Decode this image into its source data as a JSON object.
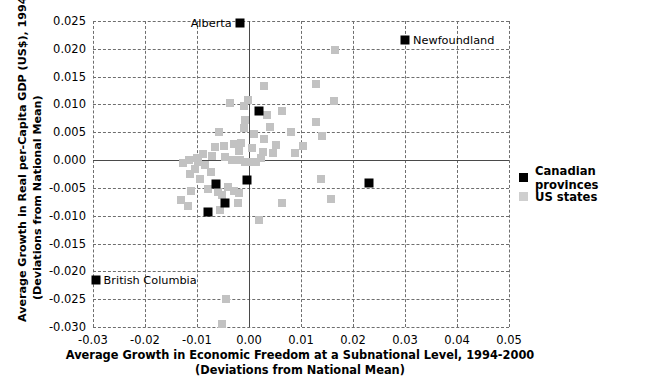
{
  "axes": {
    "ylabel_line1": "Average Growth in Real per-Capita GDP (US$), 1994-2000",
    "ylabel_line2": "(Deviations from National Mean)",
    "xlabel_line1": "Average Growth in Economic Freedom at a Subnational Level, 1994-2000",
    "xlabel_line2": "(Deviations from National Mean)",
    "yticks": [
      "0.025",
      "0.020",
      "0.015",
      "0.010",
      "0.005",
      "0.000",
      "-0.005",
      "-0.010",
      "-0.015",
      "-0.020",
      "-0.025",
      "-0.030"
    ],
    "xticks": [
      "-0.03",
      "-0.02",
      "-0.01",
      "0.00",
      "0.01",
      "0.02",
      "0.03",
      "0.04",
      "0.05"
    ]
  },
  "legend": {
    "items": [
      {
        "label": "Canadian provinces",
        "color": "#000000",
        "key": "ca"
      },
      {
        "label": "US states",
        "color": "#cfcfcf",
        "key": "us"
      }
    ]
  },
  "annotations": [
    {
      "text": "Alberta",
      "x": -0.0018,
      "y": 0.0247,
      "align": "left"
    },
    {
      "text": "Newfoundland",
      "x": 0.03,
      "y": 0.0215,
      "align": "right"
    },
    {
      "text": "British Columbia",
      "x": -0.0295,
      "y": -0.0215,
      "align": "right"
    }
  ],
  "chart_data": {
    "type": "scatter",
    "title": "",
    "xlabel": "Average Growth in Economic Freedom at a Subnational Level, 1994-2000 (Deviations from National Mean)",
    "ylabel": "Average Growth in Real per-Capita GDP (US$), 1994-2000 (Deviations from National Mean)",
    "xlim": [
      -0.03,
      0.05
    ],
    "ylim": [
      -0.03,
      0.025
    ],
    "grid": true,
    "legend_position": "right",
    "colors": {
      "canadian_provinces": "#000000",
      "us_states": "#c2c2c2"
    },
    "series": [
      {
        "name": "Canadian provinces",
        "color": "#000000",
        "points": [
          {
            "x": -0.0018,
            "y": 0.0247,
            "label": "Alberta"
          },
          {
            "x": 0.03,
            "y": 0.0215,
            "label": "Newfoundland"
          },
          {
            "x": 0.002,
            "y": 0.0088,
            "label": ""
          },
          {
            "x": -0.0004,
            "y": -0.0036,
            "label": ""
          },
          {
            "x": 0.0231,
            "y": -0.0042,
            "label": ""
          },
          {
            "x": -0.0063,
            "y": -0.0043,
            "label": ""
          },
          {
            "x": -0.0047,
            "y": -0.0077,
            "label": ""
          },
          {
            "x": -0.0078,
            "y": -0.0094,
            "label": ""
          },
          {
            "x": -0.0295,
            "y": -0.0215,
            "label": "British Columbia"
          }
        ]
      },
      {
        "name": "US states",
        "color": "#c2c2c2",
        "points": [
          {
            "x": 0.0165,
            "y": 0.0198
          },
          {
            "x": 0.0128,
            "y": 0.0136
          },
          {
            "x": 0.0028,
            "y": 0.0134
          },
          {
            "x": 0.0163,
            "y": 0.0107
          },
          {
            "x": 0.0128,
            "y": 0.0068
          },
          {
            "x": -0.0036,
            "y": 0.0102
          },
          {
            "x": -0.001,
            "y": 0.0098
          },
          {
            "x": -0.0008,
            "y": 0.0072
          },
          {
            "x": 0.0141,
            "y": 0.0044
          },
          {
            "x": 0.0035,
            "y": 0.0081
          },
          {
            "x": -0.0009,
            "y": 0.0058
          },
          {
            "x": 0.0041,
            "y": 0.006
          },
          {
            "x": 0.0081,
            "y": 0.005
          },
          {
            "x": 0.0064,
            "y": 0.0088
          },
          {
            "x": -0.0058,
            "y": 0.005
          },
          {
            "x": -0.0028,
            "y": 0.0029
          },
          {
            "x": -0.0016,
            "y": 0.003
          },
          {
            "x": 0.0029,
            "y": 0.0038
          },
          {
            "x": 0.0104,
            "y": 0.0026
          },
          {
            "x": -0.0048,
            "y": 0.0026
          },
          {
            "x": -0.0066,
            "y": 0.0023
          },
          {
            "x": 0.0088,
            "y": 0.0013
          },
          {
            "x": -0.002,
            "y": 0.0016
          },
          {
            "x": 0.0006,
            "y": 0.0021
          },
          {
            "x": -0.0089,
            "y": 0.0011
          },
          {
            "x": -0.0071,
            "y": 0.0008
          },
          {
            "x": -0.01,
            "y": 0.0004
          },
          {
            "x": -0.0115,
            "y": 0.0
          },
          {
            "x": -0.0098,
            "y": -0.0004
          },
          {
            "x": -0.0084,
            "y": -0.0008
          },
          {
            "x": -0.0046,
            "y": 0.0005
          },
          {
            "x": -0.0032,
            "y": 0.0
          },
          {
            "x": -0.0018,
            "y": 0.0
          },
          {
            "x": -0.0008,
            "y": -0.0003
          },
          {
            "x": 0.0003,
            "y": -0.0004
          },
          {
            "x": 0.0014,
            "y": -0.0004
          },
          {
            "x": 0.0024,
            "y": 0.0004
          },
          {
            "x": 0.0026,
            "y": 0.0014
          },
          {
            "x": 0.0046,
            "y": 0.0012
          },
          {
            "x": 0.0139,
            "y": -0.0034
          },
          {
            "x": -0.0104,
            "y": -0.0016
          },
          {
            "x": -0.0114,
            "y": -0.0025
          },
          {
            "x": -0.0074,
            "y": -0.0022
          },
          {
            "x": -0.0094,
            "y": -0.0034
          },
          {
            "x": -0.0078,
            "y": -0.0052
          },
          {
            "x": -0.006,
            "y": -0.0058
          },
          {
            "x": -0.0051,
            "y": -0.0062
          },
          {
            "x": -0.004,
            "y": -0.0048
          },
          {
            "x": -0.0029,
            "y": -0.0056
          },
          {
            "x": -0.002,
            "y": -0.006
          },
          {
            "x": -0.0112,
            "y": -0.0056
          },
          {
            "x": -0.013,
            "y": -0.0072
          },
          {
            "x": -0.0118,
            "y": -0.0082
          },
          {
            "x": -0.0022,
            "y": -0.0078
          },
          {
            "x": 0.0063,
            "y": -0.0078
          },
          {
            "x": 0.0158,
            "y": -0.007
          },
          {
            "x": 0.002,
            "y": -0.0107
          },
          {
            "x": -0.0056,
            "y": -0.009
          },
          {
            "x": -0.0044,
            "y": -0.025
          },
          {
            "x": -0.0051,
            "y": -0.0295
          },
          {
            "x": -0.0126,
            "y": -0.0006
          },
          {
            "x": 0.0052,
            "y": 0.0028
          },
          {
            "x": 0.001,
            "y": 0.0046
          },
          {
            "x": -0.0001,
            "y": 0.0108
          }
        ]
      }
    ]
  }
}
